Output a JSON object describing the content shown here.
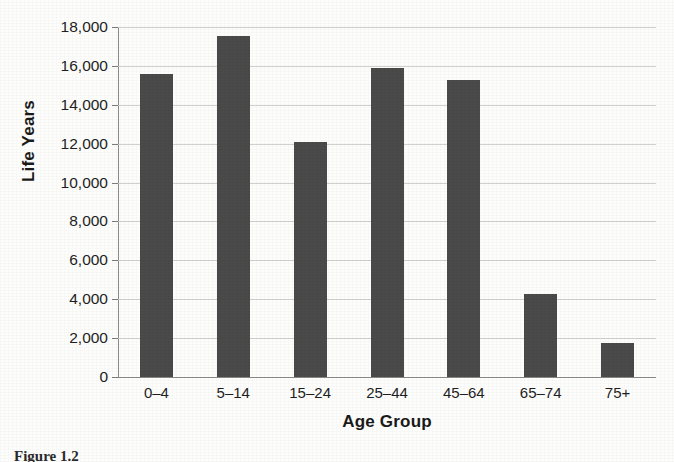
{
  "chart_data": {
    "type": "bar",
    "title": "",
    "xlabel": "Age Group",
    "ylabel": "Life Years",
    "categories": [
      "0–4",
      "5–14",
      "15–24",
      "25–44",
      "45–64",
      "65–74",
      "75+"
    ],
    "values": [
      15600,
      17550,
      12100,
      15900,
      15300,
      4250,
      1750
    ],
    "ylim": [
      0,
      18000
    ],
    "ytick_step": 2000,
    "ytick_labels": [
      "18,000",
      "16,000",
      "14,000",
      "12,000",
      "10,000",
      "8,000",
      "6,000",
      "4,000",
      "2,000",
      "0"
    ],
    "ytick_values": [
      18000,
      16000,
      14000,
      12000,
      10000,
      8000,
      6000,
      4000,
      2000,
      0
    ],
    "grid": true,
    "grid_axis": "y",
    "legend": false,
    "bar_color": "#4a4a4a",
    "gridline_color": "#c9c9c9",
    "axis_color": "#8a8a8a",
    "text_color": "#1f1f1f",
    "background_color": "#fdfdfc"
  },
  "figure": {
    "caption": "Figure 1.2"
  }
}
